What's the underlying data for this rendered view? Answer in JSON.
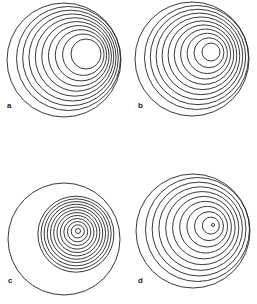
{
  "figure": {
    "stroke_color": "#222222",
    "background": "#ffffff",
    "panels": [
      {
        "label": "a",
        "outer": {
          "cx": 64,
          "cy": 60,
          "r": 57
        },
        "inner": {
          "cx": 86,
          "cy": 54,
          "r": 15
        },
        "rings": 9,
        "label_pos": {
          "x": 7,
          "y": 109
        }
      },
      {
        "label": "b",
        "outer": {
          "cx": 192,
          "cy": 59,
          "r": 57
        },
        "inner": {
          "cx": 211,
          "cy": 52,
          "r": 9
        },
        "rings": 10,
        "label_pos": {
          "x": 138,
          "y": 109
        }
      },
      {
        "label": "c",
        "outer": {
          "cx": 64,
          "cy": 239,
          "r": 56
        },
        "inner": {
          "cx": 78,
          "cy": 231,
          "r": 2.5
        },
        "rings": 12,
        "inner_span_r": 38,
        "label_pos": {
          "x": 8,
          "y": 284
        }
      },
      {
        "label": "d",
        "outer": {
          "cx": 193,
          "cy": 231,
          "r": 57
        },
        "inner": {
          "cx": 213,
          "cy": 225,
          "r": 1.5
        },
        "rings": 10,
        "label_pos": {
          "x": 138,
          "y": 284
        }
      }
    ]
  }
}
